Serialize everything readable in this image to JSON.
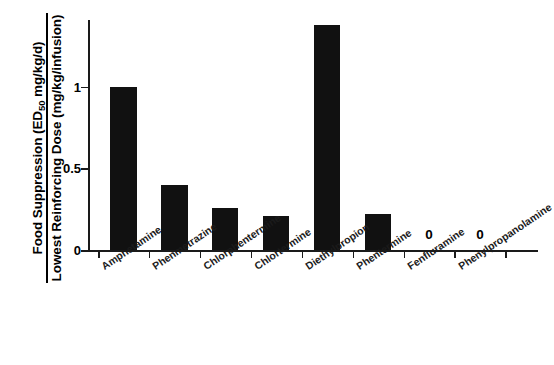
{
  "chart_data": {
    "type": "bar",
    "title": "",
    "subtitle": "",
    "xlabel": "",
    "ylabel_numerator": "Food Suppression (ED50 mg/kg/d)",
    "ylabel_denominator": "Lowest Reinforcing Dose (mg/kg/infusion)",
    "ylabel_numerator_parts": {
      "before_sub": "Food Suppression (ED",
      "sub": "50",
      "after_sub": " mg/kg/d)"
    },
    "categories": [
      "Amphetamine",
      "Phenmetrazine",
      "Chlorphentermine",
      "Chlortermine",
      "Diethylpropion",
      "Phentermine",
      "Fenfluramine",
      "Phenylpropanolamine"
    ],
    "values": [
      1.0,
      0.4,
      0.26,
      0.21,
      1.38,
      0.22,
      0,
      0
    ],
    "point_labels": [
      "",
      "",
      "",
      "",
      "",
      "",
      "0",
      "0"
    ],
    "ylim": [
      0,
      1.42
    ],
    "yticks": [
      0,
      0.5,
      1
    ],
    "ytick_labels": [
      "0",
      "0.5",
      "1"
    ],
    "grid": false,
    "legend": false,
    "bar_color": "#111111",
    "axis_color": "#1a1a1a"
  }
}
